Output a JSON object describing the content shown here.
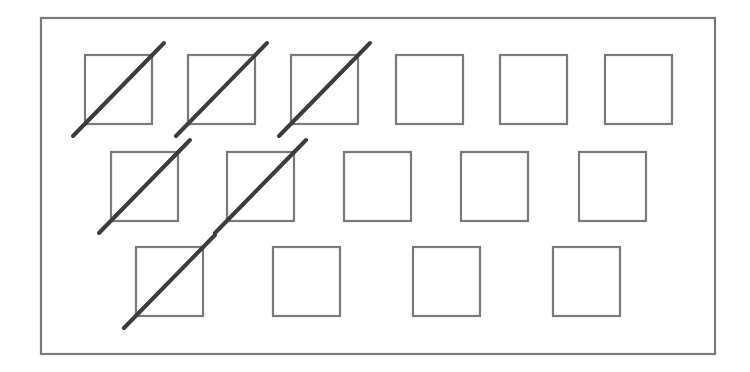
{
  "diagram": {
    "title": "",
    "frame": {
      "x": 41,
      "y": 18,
      "width": 674,
      "height": 336,
      "stroke": "#7a7a7a",
      "stroke_width": 2.2
    },
    "box_style": {
      "width": 67,
      "height": 69,
      "stroke": "#7a7a7a",
      "stroke_width": 2.2,
      "fill": "none"
    },
    "slash_style": {
      "stroke": "#3c3c3c",
      "stroke_width": 4
    },
    "rows": [
      {
        "name": "row-1",
        "boxes": [
          {
            "x": 85,
            "y": 55,
            "crossed": true
          },
          {
            "x": 188,
            "y": 55,
            "crossed": true
          },
          {
            "x": 291,
            "y": 55,
            "crossed": true
          },
          {
            "x": 396,
            "y": 55,
            "crossed": false
          },
          {
            "x": 500,
            "y": 55,
            "crossed": false
          },
          {
            "x": 605,
            "y": 55,
            "crossed": false
          }
        ]
      },
      {
        "name": "row-2",
        "boxes": [
          {
            "x": 111,
            "y": 152,
            "crossed": true
          },
          {
            "x": 227,
            "y": 152,
            "crossed": true
          },
          {
            "x": 344,
            "y": 152,
            "crossed": false
          },
          {
            "x": 461,
            "y": 152,
            "crossed": false
          },
          {
            "x": 579,
            "y": 152,
            "crossed": false
          }
        ]
      },
      {
        "name": "row-3",
        "boxes": [
          {
            "x": 136,
            "y": 247,
            "crossed": true
          },
          {
            "x": 273,
            "y": 247,
            "crossed": false
          },
          {
            "x": 413,
            "y": 247,
            "crossed": false
          },
          {
            "x": 553,
            "y": 247,
            "crossed": false
          }
        ]
      }
    ],
    "summary": {
      "total_boxes": 15,
      "crossed_boxes": 6,
      "uncrossed_boxes": 9
    }
  }
}
